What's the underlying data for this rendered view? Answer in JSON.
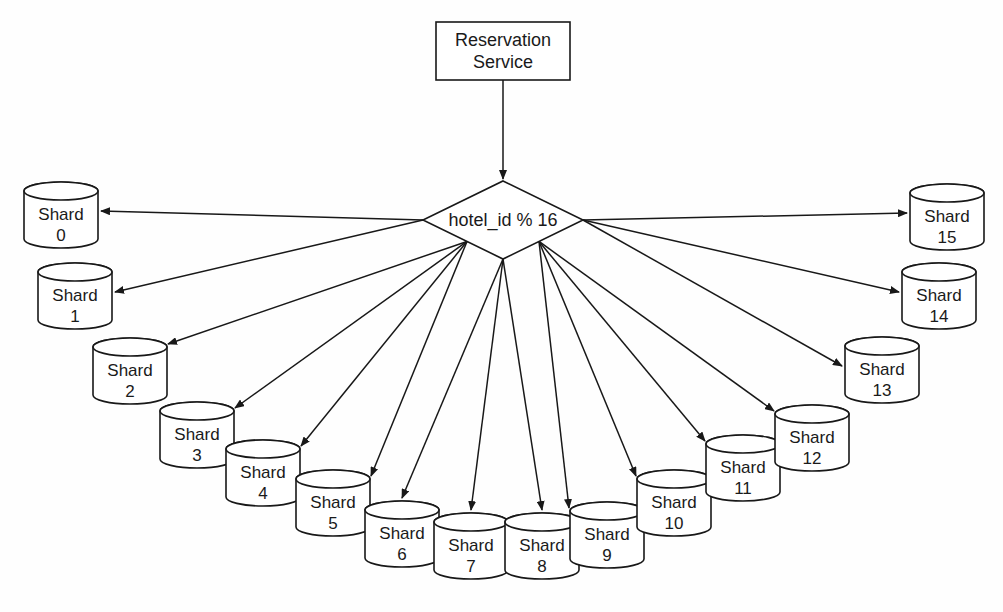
{
  "diagram": {
    "type": "flow-diagram",
    "background_color": "#fefefe",
    "stroke_color": "#181818",
    "fill_color": "#ffffff",
    "service": {
      "label_line1": "Reservation",
      "label_line2": "Service",
      "shape": "rectangle",
      "x": 436,
      "y": 22,
      "width": 134,
      "height": 58
    },
    "router": {
      "label": "hotel_id % 16",
      "shape": "diamond",
      "cx": 503,
      "cy": 220,
      "rx": 80,
      "ry": 39
    },
    "shard_label_prefix": "Shard",
    "shard_count": 16,
    "shards": [
      {
        "id": 0,
        "label": "Shard",
        "number": "0",
        "x": 24,
        "y": 182,
        "width": 74,
        "height": 66,
        "arrow_side": "right"
      },
      {
        "id": 1,
        "label": "Shard",
        "number": "1",
        "x": 38,
        "y": 263,
        "width": 74,
        "height": 66,
        "arrow_side": "right"
      },
      {
        "id": 2,
        "label": "Shard",
        "number": "2",
        "x": 93,
        "y": 338,
        "width": 74,
        "height": 66,
        "arrow_side": "topright"
      },
      {
        "id": 3,
        "label": "Shard",
        "number": "3",
        "x": 160,
        "y": 402,
        "width": 74,
        "height": 66,
        "arrow_side": "topright"
      },
      {
        "id": 4,
        "label": "Shard",
        "number": "4",
        "x": 226,
        "y": 440,
        "width": 74,
        "height": 66,
        "arrow_side": "topright"
      },
      {
        "id": 5,
        "label": "Shard",
        "number": "5",
        "x": 296,
        "y": 470,
        "width": 74,
        "height": 66,
        "arrow_side": "topright"
      },
      {
        "id": 6,
        "label": "Shard",
        "number": "6",
        "x": 365,
        "y": 501,
        "width": 74,
        "height": 66,
        "arrow_side": "top"
      },
      {
        "id": 7,
        "label": "Shard",
        "number": "7",
        "x": 434,
        "y": 513,
        "width": 74,
        "height": 66,
        "arrow_side": "top"
      },
      {
        "id": 8,
        "label": "Shard",
        "number": "8",
        "x": 505,
        "y": 513,
        "width": 74,
        "height": 66,
        "arrow_side": "top"
      },
      {
        "id": 9,
        "label": "Shard",
        "number": "9",
        "x": 570,
        "y": 502,
        "width": 74,
        "height": 66,
        "arrow_side": "topleft"
      },
      {
        "id": 10,
        "label": "Shard",
        "number": "10",
        "x": 637,
        "y": 470,
        "width": 74,
        "height": 66,
        "arrow_side": "topleft"
      },
      {
        "id": 11,
        "label": "Shard",
        "number": "11",
        "x": 706,
        "y": 435,
        "width": 74,
        "height": 66,
        "arrow_side": "topleft"
      },
      {
        "id": 12,
        "label": "Shard",
        "number": "12",
        "x": 775,
        "y": 405,
        "width": 74,
        "height": 66,
        "arrow_side": "topleft"
      },
      {
        "id": 13,
        "label": "Shard",
        "number": "13",
        "x": 845,
        "y": 337,
        "width": 74,
        "height": 66,
        "arrow_side": "left"
      },
      {
        "id": 14,
        "label": "Shard",
        "number": "14",
        "x": 902,
        "y": 263,
        "width": 74,
        "height": 66,
        "arrow_side": "left"
      },
      {
        "id": 15,
        "label": "Shard",
        "number": "15",
        "x": 910,
        "y": 184,
        "width": 74,
        "height": 66,
        "arrow_side": "left"
      }
    ],
    "edges": {
      "service_to_router": {
        "from": "Reservation Service",
        "to": "hotel_id % 16",
        "arrow": true
      },
      "router_to_shards_label": "hotel_id % 16 routes to Shard 0 through Shard 15",
      "arrow_count": 16
    }
  }
}
